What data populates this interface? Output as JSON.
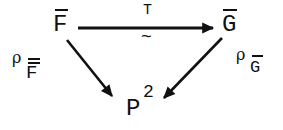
{
  "diagram": {
    "type": "commutative-triangle",
    "nodes": {
      "top_left": {
        "label": "F",
        "decoration": "overline"
      },
      "top_right": {
        "label": "G",
        "decoration": "overline"
      },
      "bottom": {
        "label": "P",
        "superscript": "2"
      }
    },
    "arrows": [
      {
        "from": "top_left",
        "to": "top_right",
        "label_above": "T",
        "label_below": "~"
      },
      {
        "from": "top_left",
        "to": "bottom",
        "label": {
          "symbol": "ρ",
          "subscript": "F",
          "subscript_decoration": "overline"
        }
      },
      {
        "from": "top_right",
        "to": "bottom",
        "label": {
          "symbol": "ρ",
          "subscript": "G",
          "subscript_decoration": "overline"
        }
      }
    ],
    "colors": {
      "ink": "#111111",
      "background": "#ffffff"
    }
  }
}
